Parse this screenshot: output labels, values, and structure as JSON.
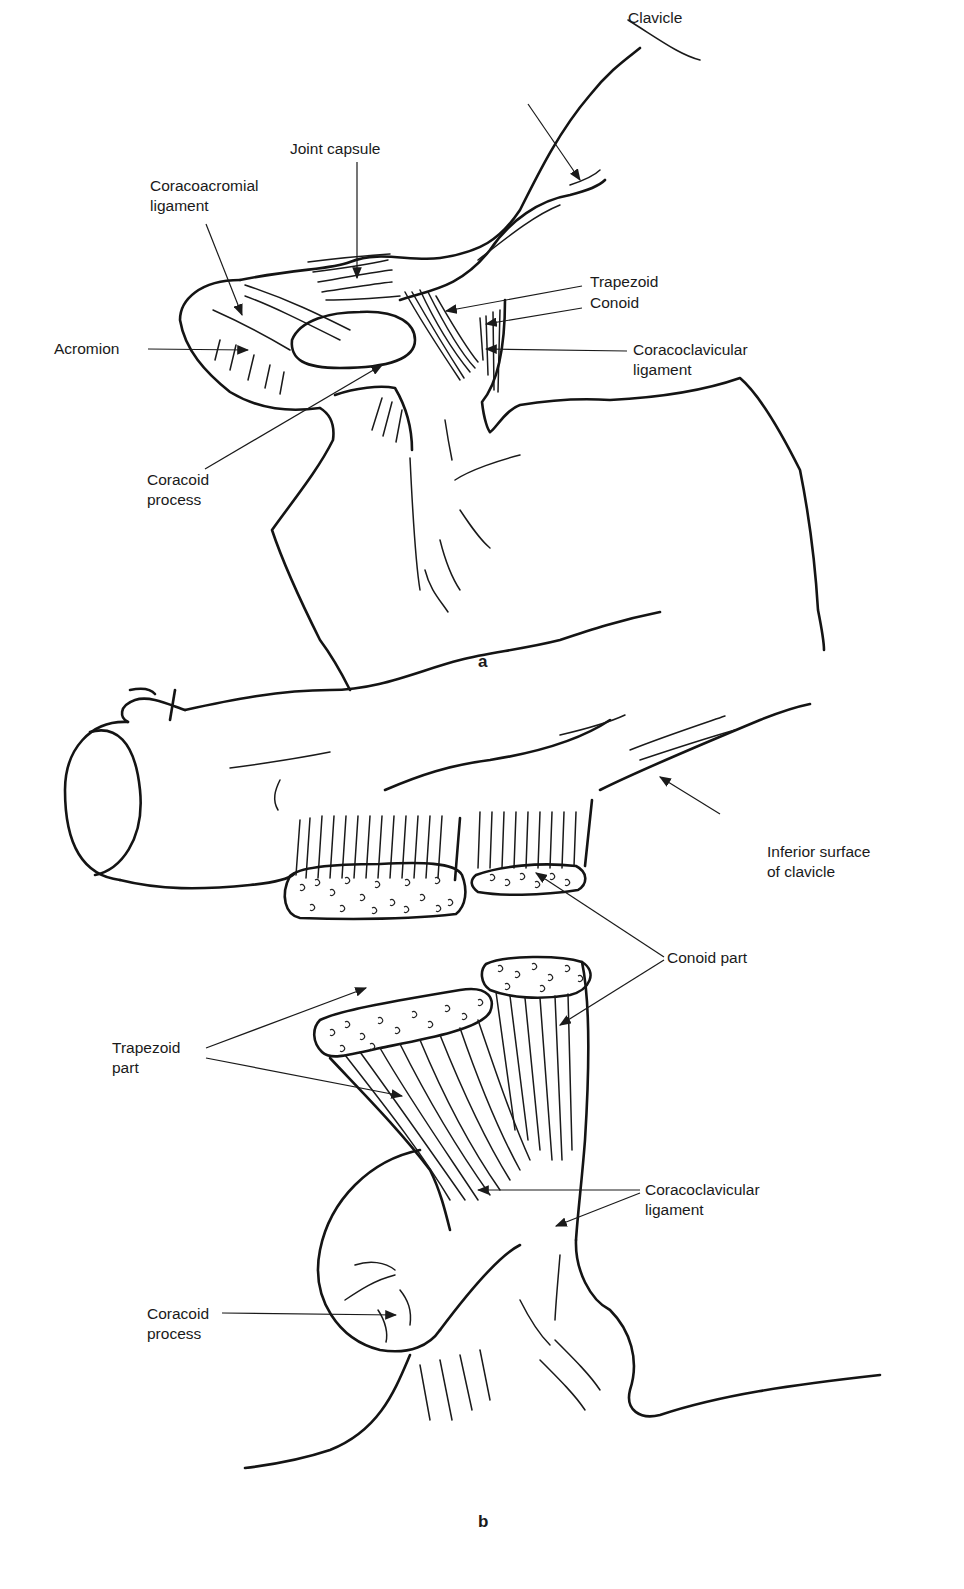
{
  "figure_a": {
    "panel_label": "a",
    "labels": {
      "clavicle": "Clavicle",
      "joint_capsule": "Joint capsule",
      "coracoacromial_ligament": "Coracoacromial\nligament",
      "trapezoid": "Trapezoid",
      "conoid": "Conoid",
      "acromion": "Acromion",
      "coracoclavicular_ligament": "Coracoclavicular\nligament",
      "coracoid_process": "Coracoid\nprocess"
    }
  },
  "figure_b": {
    "panel_label": "b",
    "labels": {
      "inferior_surface": "Inferior surface\nof clavicle",
      "conoid_part": "Conoid part",
      "trapezoid_part": "Trapezoid\npart",
      "coracoclavicular_ligament": "Coracoclavicular\nligament",
      "coracoid_process": "Coracoid\nprocess"
    }
  },
  "colors": {
    "ink": "#141414",
    "background": "#ffffff"
  }
}
